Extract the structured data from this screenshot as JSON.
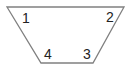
{
  "diagram": {
    "shape": "trapezoid",
    "stroke_color": "#808080",
    "label_color": "#222222",
    "vertices": [
      {
        "x": 7,
        "y": 7
      },
      {
        "x": 124,
        "y": 7
      },
      {
        "x": 93,
        "y": 63
      },
      {
        "x": 41,
        "y": 63
      }
    ],
    "labels": [
      {
        "text": "1",
        "x": 22,
        "y": 23
      },
      {
        "text": "2",
        "x": 106,
        "y": 22
      },
      {
        "text": "3",
        "x": 83,
        "y": 59
      },
      {
        "text": "4",
        "x": 44,
        "y": 59
      }
    ]
  }
}
